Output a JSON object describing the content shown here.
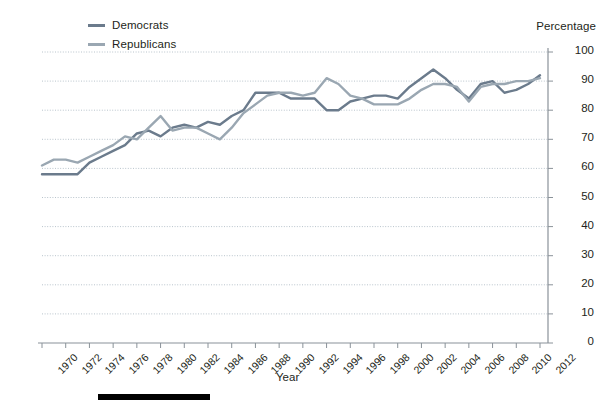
{
  "legend": {
    "position": "top-left",
    "items": [
      {
        "label": "Democrats",
        "color": "#6b7b8c",
        "icon": "line-swatch-icon"
      },
      {
        "label": "Republicans",
        "color": "#9aa7b2",
        "icon": "line-swatch-icon"
      }
    ]
  },
  "axes": {
    "y_title": "Percentage",
    "x_title": "Year",
    "y_ticks": [
      "0",
      "10",
      "20",
      "30",
      "40",
      "50",
      "60",
      "70",
      "80",
      "90",
      "100"
    ],
    "x_ticks": [
      "1970",
      "1972",
      "1974",
      "1976",
      "1978",
      "1980",
      "1982",
      "1984",
      "1986",
      "1988",
      "1990",
      "1992",
      "1994",
      "1996",
      "1998",
      "2000",
      "2002",
      "2004",
      "2006",
      "2008",
      "2010",
      "2012"
    ]
  },
  "colors": {
    "democrats": "#6b7b8c",
    "republicans": "#9aa7b2",
    "gridline": "#b9c4cc",
    "axis": "#8a9299",
    "text": "#231f20",
    "bottom_bar": "#000000"
  },
  "chart_data": {
    "type": "line",
    "title": "",
    "subtitle": "",
    "xlabel": "Year",
    "ylabel": "Percentage",
    "xlim": [
      1970,
      2012
    ],
    "ylim": [
      0,
      100
    ],
    "grid": true,
    "legend_position": "top-left",
    "x": [
      1970,
      1971,
      1972,
      1973,
      1974,
      1975,
      1976,
      1977,
      1978,
      1979,
      1980,
      1981,
      1982,
      1983,
      1984,
      1985,
      1986,
      1987,
      1988,
      1989,
      1990,
      1991,
      1992,
      1993,
      1994,
      1995,
      1996,
      1997,
      1998,
      1999,
      2000,
      2001,
      2002,
      2003,
      2004,
      2005,
      2006,
      2007,
      2008,
      2009,
      2010,
      2011,
      2012
    ],
    "series": [
      {
        "name": "Democrats",
        "color": "#6b7b8c",
        "values": [
          58,
          58,
          58,
          58,
          62,
          64,
          66,
          68,
          72,
          73,
          71,
          74,
          75,
          74,
          76,
          75,
          78,
          80,
          86,
          86,
          86,
          84,
          84,
          84,
          80,
          80,
          83,
          84,
          85,
          85,
          84,
          88,
          91,
          94,
          91,
          87,
          84,
          89,
          90,
          86,
          87,
          89,
          92
        ]
      },
      {
        "name": "Republicans",
        "color": "#9aa7b2",
        "values": [
          61,
          63,
          63,
          62,
          64,
          66,
          68,
          71,
          70,
          74,
          78,
          73,
          74,
          74,
          72,
          70,
          74,
          79,
          82,
          85,
          86,
          86,
          85,
          86,
          91,
          89,
          85,
          84,
          82,
          82,
          82,
          84,
          87,
          89,
          89,
          88,
          83,
          88,
          89,
          89,
          90,
          90,
          91
        ]
      }
    ]
  },
  "decorations": {
    "bottom_bar": ""
  }
}
